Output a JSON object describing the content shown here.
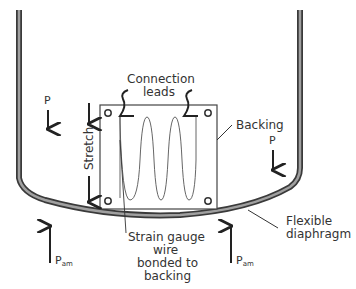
{
  "diagram": {
    "labels": {
      "connection_leads_1": "Connection",
      "connection_leads_2": "leads",
      "backing": "Backing",
      "stretch": "Stretch",
      "pressure_left": "P",
      "pressure_right": "P",
      "ambient_left_main": "P",
      "ambient_left_sub": "am",
      "ambient_right_main": "P",
      "ambient_right_sub": "am",
      "strain_1": "Strain gauge",
      "strain_2": "wire",
      "strain_3": "bonded to",
      "strain_4": "backing",
      "diaphragm_1": "Flexible",
      "diaphragm_2": "diaphragm"
    },
    "colors": {
      "wall_outer": "#3a3a3a",
      "wall_fill": "#9a9a9a",
      "line": "#333333",
      "text": "#333333",
      "background": "#ffffff"
    }
  }
}
